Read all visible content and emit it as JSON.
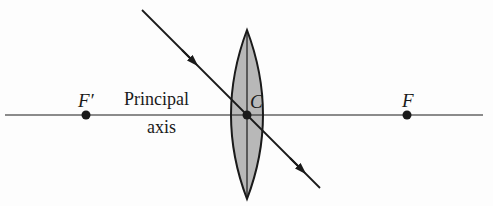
{
  "diagram": {
    "type": "thin converging lens ray diagram",
    "labels": {
      "focal_point_left": "F′",
      "focal_point_right": "F",
      "center": "C",
      "axis_line1": "Principal",
      "axis_line2": "axis"
    },
    "colors": {
      "ink": "#1a1a1a",
      "lens_fill": "#b8b8b8",
      "background": "#fdfdfd"
    },
    "geometry": {
      "axis": {
        "x1": 5,
        "x2": 483,
        "y": 115
      },
      "lens": {
        "cx": 247,
        "top": 30,
        "bottom": 199,
        "half_width": 16
      },
      "points": {
        "F_prime": [
          86,
          115
        ],
        "C": [
          247,
          115
        ],
        "F": [
          407,
          115
        ]
      },
      "ray": {
        "x1": 142,
        "y1": 10,
        "x2": 320,
        "y2": 188
      }
    }
  }
}
